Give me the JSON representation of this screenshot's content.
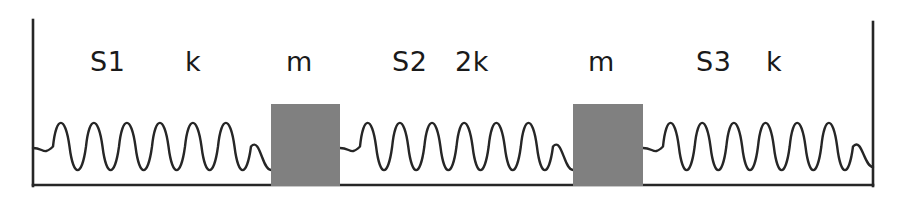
{
  "diagram": {
    "type": "physics-schematic",
    "canvas": {
      "width": 900,
      "height": 199
    },
    "colors": {
      "background": "#ffffff",
      "stroke": "#262626",
      "mass_fill": "#808080",
      "label_text": "#1a1a1a"
    },
    "ground": {
      "name": "baseline",
      "y": 185,
      "x_start": 33,
      "x_end": 873
    },
    "walls": [
      {
        "name": "left-wall",
        "x": 33,
        "y_top": 20,
        "y_bottom": 186
      },
      {
        "name": "right-wall",
        "x": 873,
        "y_top": 22,
        "y_bottom": 186
      }
    ],
    "springs": [
      {
        "id": "S1",
        "label": "S1",
        "stiffness_label": "k",
        "coils": 6,
        "x_start": 33,
        "x_end": 271,
        "lead_left_y": 148,
        "lead_right_y": 170,
        "peak_y": 115,
        "trough_y": 178
      },
      {
        "id": "S2",
        "label": "S2",
        "stiffness_label": "2k",
        "coils": 6,
        "x_start": 340,
        "x_end": 573,
        "lead_left_y": 148,
        "lead_right_y": 170,
        "peak_y": 115,
        "trough_y": 178
      },
      {
        "id": "S3",
        "label": "S3",
        "stiffness_label": "k",
        "coils": 6,
        "x_start": 643,
        "x_end": 873,
        "lead_left_y": 148,
        "lead_right_y": 167,
        "peak_y": 115,
        "trough_y": 178
      }
    ],
    "masses": [
      {
        "id": "m1",
        "label": "m",
        "x": 271,
        "y": 104,
        "width": 69,
        "height": 82
      },
      {
        "id": "m2",
        "label": "m",
        "x": 573,
        "y": 104,
        "width": 70,
        "height": 82
      }
    ],
    "labels": [
      {
        "name": "spring-label-s1",
        "text": "S1",
        "x": 90,
        "y": 48
      },
      {
        "name": "stiffness-label-k1",
        "text": "k",
        "x": 185,
        "y": 48
      },
      {
        "name": "mass-label-m1",
        "text": "m",
        "x": 286,
        "y": 48
      },
      {
        "name": "spring-label-s2",
        "text": "S2",
        "x": 392,
        "y": 48
      },
      {
        "name": "stiffness-label-2k",
        "text": "2k",
        "x": 455,
        "y": 48
      },
      {
        "name": "mass-label-m2",
        "text": "m",
        "x": 588,
        "y": 48
      },
      {
        "name": "spring-label-s3",
        "text": "S3",
        "x": 696,
        "y": 48
      },
      {
        "name": "stiffness-label-k3",
        "text": "k",
        "x": 766,
        "y": 48
      }
    ]
  }
}
